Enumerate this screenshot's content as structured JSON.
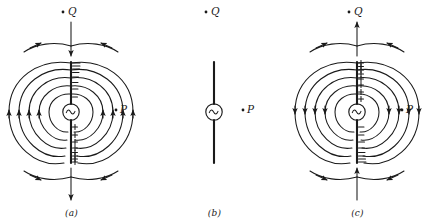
{
  "figure": {
    "stroke_color": "#1a1a1a",
    "background_color": "#ffffff",
    "panels": [
      {
        "key": "a",
        "label": "(a)",
        "point_q": "Q",
        "point_p": "P",
        "source_symbol": "~",
        "upper_charge_sign": "−",
        "lower_charge_sign": "+",
        "upper_charge_count": 8,
        "lower_charge_count": 8,
        "center_arrow_direction": "down",
        "side_arrow_direction": "up",
        "top_arc_arrow_direction": "inward",
        "bottom_arc_arrow_direction": "inward"
      },
      {
        "key": "b",
        "label": "(b)",
        "point_q": "Q",
        "point_p": "P",
        "source_symbol": "~",
        "upper_charge_sign": "",
        "lower_charge_sign": "",
        "upper_charge_count": 0,
        "lower_charge_count": 0,
        "center_arrow_direction": "none",
        "side_arrow_direction": "none",
        "top_arc_arrow_direction": "none",
        "bottom_arc_arrow_direction": "none"
      },
      {
        "key": "c",
        "label": "(c)",
        "point_q": "Q",
        "point_p": "P",
        "source_symbol": "~",
        "upper_charge_sign": "+",
        "lower_charge_sign": "−",
        "upper_charge_count": 8,
        "lower_charge_count": 8,
        "center_arrow_direction": "up",
        "side_arrow_direction": "down",
        "top_arc_arrow_direction": "outward",
        "bottom_arc_arrow_direction": "inward"
      }
    ]
  }
}
